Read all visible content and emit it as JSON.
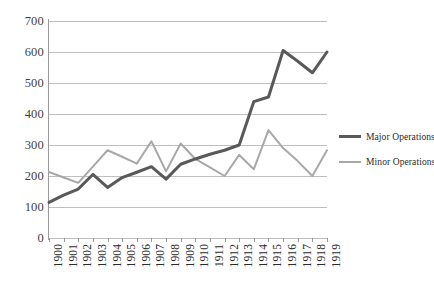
{
  "chart_data": {
    "type": "line",
    "title": "",
    "subtitle": "",
    "xlabel": "",
    "ylabel": "",
    "xlim": [
      1900,
      1919
    ],
    "ylim": [
      0,
      700
    ],
    "ytick_step": 100,
    "grid": true,
    "grid_axis": "y",
    "legend_position": "right",
    "categories": [
      "1900",
      "1901",
      "1902",
      "1903",
      "1904",
      "1905",
      "1906",
      "1907",
      "1908",
      "1909",
      "1910",
      "1911",
      "1912",
      "1913",
      "1914",
      "1915",
      "1916",
      "1917",
      "1918",
      "1919"
    ],
    "yticks": [
      "0",
      "100",
      "200",
      "300",
      "400",
      "500",
      "600",
      "700"
    ],
    "series": [
      {
        "name": "Major Operations",
        "color": "#595959",
        "width": 3,
        "values": [
          115,
          138,
          158,
          205,
          163,
          195,
          212,
          230,
          190,
          238,
          255,
          270,
          283,
          300,
          440,
          455,
          605,
          570,
          533,
          600
        ]
      },
      {
        "name": "Minor Operations",
        "color": "#a8a8a8",
        "width": 2,
        "values": [
          213,
          195,
          178,
          230,
          283,
          262,
          240,
          312,
          215,
          305,
          255,
          228,
          200,
          268,
          222,
          348,
          290,
          248,
          200,
          283
        ]
      }
    ]
  },
  "legend": {
    "items": [
      {
        "label": "Major Operations"
      },
      {
        "label": "Minor Operations"
      }
    ]
  },
  "colors": {
    "major": "#595959",
    "minor": "#a8a8a8",
    "gridline": "#bfbfbf",
    "axis": "#9a9a9a",
    "text": "#2b2b2b",
    "background": "#ffffff"
  }
}
